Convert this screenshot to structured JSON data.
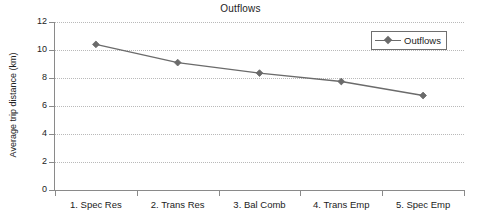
{
  "chart_data": {
    "type": "line",
    "title": "Outflows",
    "xlabel": "",
    "ylabel": "Average trip distance (km)",
    "categories": [
      "1. Spec Res",
      "2. Trans Res",
      "3. Bal Comb",
      "4. Trans Emp",
      "5. Spec Emp"
    ],
    "series": [
      {
        "name": "Outflows",
        "values": [
          10.4,
          9.1,
          8.35,
          7.75,
          6.75
        ],
        "color": "#6b6b6b",
        "marker": "diamond"
      }
    ],
    "ylim": [
      0,
      12
    ],
    "ytick_labels": [
      "0",
      "2",
      "4",
      "6",
      "8",
      "10",
      "12"
    ],
    "ytick_values": [
      0,
      2,
      4,
      6,
      8,
      10,
      12
    ],
    "grid": "horizontal-dotted",
    "legend_position": "top-right",
    "legend_entries": [
      "Outflows"
    ],
    "axis_color": "#8a8a8a",
    "grid_color": "#b9b9b9",
    "background": "#ffffff"
  }
}
